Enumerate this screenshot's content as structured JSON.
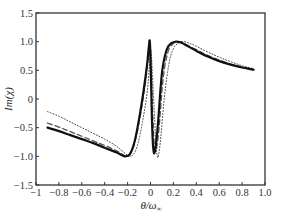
{
  "chart_data": {
    "type": "line",
    "title": "",
    "xlabel": "θ/ω_∞",
    "xlabel_main": "θ/ω",
    "xlabel_sub": "∞",
    "ylabel": "Im(χ)",
    "xlim": [
      -1,
      1
    ],
    "ylim": [
      -1.5,
      1.5
    ],
    "grid": false,
    "legend": null,
    "x_ticks": [
      -1,
      -0.8,
      -0.6,
      -0.4,
      -0.2,
      0,
      0.2,
      0.4,
      0.6,
      0.8,
      1.0
    ],
    "x_tick_labels": [
      "−1",
      "−0.8",
      "−0.6",
      "−0.4",
      "−0.2",
      "0",
      "0.2",
      "0.4",
      "0.6",
      "0.8",
      "1.0"
    ],
    "y_ticks": [
      1.5,
      1.0,
      0.5,
      0,
      -0.5,
      -1.0,
      -1.5
    ],
    "y_tick_labels": [
      "1.5",
      "1.0",
      "0.5",
      "0",
      "−0.5",
      "−1.0",
      "−1.5"
    ],
    "series": [
      {
        "name": "solid",
        "style": "solid",
        "width": 2.2,
        "color": "#111111",
        "x": [
          -0.9,
          -0.8,
          -0.7,
          -0.6,
          -0.5,
          -0.4,
          -0.3,
          -0.25,
          -0.22,
          -0.18,
          -0.14,
          -0.1,
          -0.06,
          -0.03,
          -0.015,
          -0.005,
          0.005,
          0.015,
          0.03,
          0.06,
          0.1,
          0.14,
          0.18,
          0.22,
          0.26,
          0.3,
          0.4,
          0.5,
          0.6,
          0.7,
          0.8,
          0.9
        ],
        "y": [
          -0.5,
          -0.56,
          -0.63,
          -0.7,
          -0.77,
          -0.85,
          -0.93,
          -0.98,
          -1.0,
          -0.96,
          -0.75,
          -0.35,
          0.15,
          0.6,
          0.9,
          0.98,
          0.3,
          -0.5,
          -0.95,
          -0.55,
          0.45,
          0.85,
          0.97,
          1.0,
          0.99,
          0.95,
          0.84,
          0.74,
          0.66,
          0.6,
          0.55,
          0.51
        ]
      },
      {
        "name": "dashed",
        "style": "dashed",
        "width": 1.3,
        "color": "#555555",
        "x": [
          -0.9,
          -0.8,
          -0.7,
          -0.6,
          -0.5,
          -0.4,
          -0.3,
          -0.25,
          -0.21,
          -0.17,
          -0.13,
          -0.09,
          -0.05,
          -0.02,
          -0.005,
          0.005,
          0.02,
          0.04,
          0.07,
          0.11,
          0.15,
          0.19,
          0.23,
          0.27,
          0.3,
          0.4,
          0.5,
          0.6,
          0.7,
          0.8,
          0.9
        ],
        "y": [
          -0.42,
          -0.49,
          -0.57,
          -0.65,
          -0.73,
          -0.81,
          -0.9,
          -0.96,
          -0.99,
          -0.94,
          -0.7,
          -0.3,
          0.2,
          0.7,
          0.95,
          0.6,
          -0.3,
          -0.9,
          -0.6,
          0.35,
          0.8,
          0.95,
          0.99,
          0.99,
          0.96,
          0.86,
          0.76,
          0.68,
          0.61,
          0.56,
          0.52
        ]
      },
      {
        "name": "dotted",
        "style": "dotted",
        "width": 1.0,
        "color": "#444444",
        "x": [
          -0.9,
          -0.8,
          -0.7,
          -0.6,
          -0.5,
          -0.4,
          -0.3,
          -0.24,
          -0.19,
          -0.15,
          -0.11,
          -0.07,
          -0.03,
          -0.01,
          0.0,
          0.01,
          0.03,
          0.055,
          0.08,
          0.12,
          0.16,
          0.2,
          0.25,
          0.29,
          0.33,
          0.4,
          0.5,
          0.6,
          0.7,
          0.8,
          0.9
        ],
        "y": [
          -0.22,
          -0.3,
          -0.4,
          -0.5,
          -0.6,
          -0.7,
          -0.82,
          -0.92,
          -0.99,
          -0.97,
          -0.78,
          -0.4,
          0.1,
          0.55,
          0.85,
          0.7,
          -0.1,
          -0.95,
          -0.85,
          0.0,
          0.6,
          0.88,
          0.98,
          1.0,
          0.98,
          0.92,
          0.82,
          0.73,
          0.65,
          0.58,
          0.53
        ]
      }
    ]
  }
}
